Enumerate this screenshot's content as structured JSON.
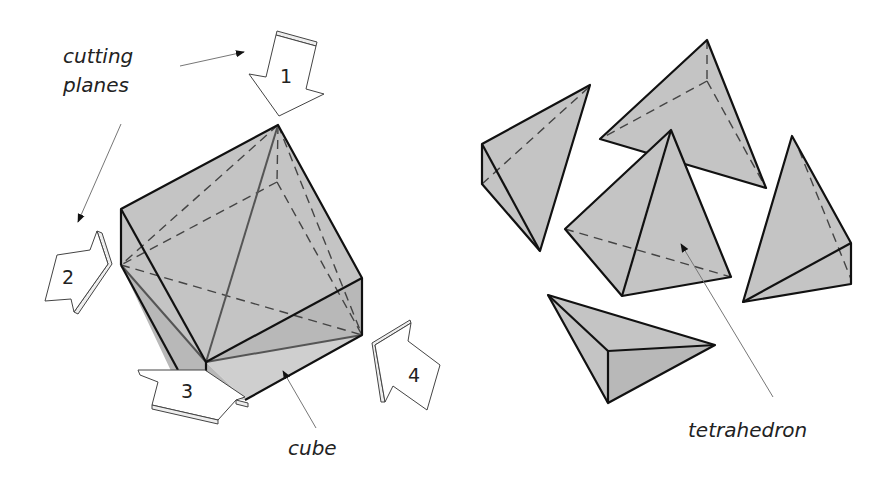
{
  "figure": {
    "left": {
      "title": "cube cut into tetrahedra",
      "labels": {
        "cutting_planes_line1": "cutting",
        "cutting_planes_line2": "planes",
        "cube": "cube"
      },
      "arrows": [
        {
          "number": "1"
        },
        {
          "number": "2"
        },
        {
          "number": "3"
        },
        {
          "number": "4"
        }
      ]
    },
    "right": {
      "labels": {
        "tetrahedron": "tetrahedron"
      },
      "piece_count": 5
    },
    "colors": {
      "fill": "#c4c4c4",
      "edge": "#111111",
      "background": "#ffffff"
    }
  }
}
